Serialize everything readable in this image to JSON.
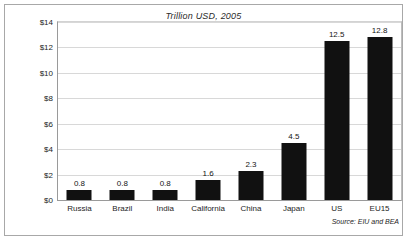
{
  "figure": {
    "title": "Trillion USD, 2005",
    "source_note": "Source: EIU and BEA"
  },
  "colors": {
    "bar": "#111111",
    "gridline": "#d8d8d8",
    "axis": "#9a9a9a",
    "frame": "#a8a8a8",
    "text": "#1d1d1d"
  },
  "chart_data": {
    "type": "bar",
    "title": "Trillion USD, 2005",
    "xlabel": "",
    "ylabel": "",
    "ylim": [
      0,
      14
    ],
    "grid": true,
    "legend": false,
    "categories": [
      "Russia",
      "Brazil",
      "India",
      "California",
      "China",
      "Japan",
      "US",
      "EU15"
    ],
    "values": [
      0.8,
      0.8,
      0.8,
      1.6,
      2.3,
      4.5,
      12.5,
      12.8
    ],
    "value_labels": [
      "0.8",
      "0.8",
      "0.8",
      "1.6",
      "2.3",
      "4.5",
      "12.5",
      "12.8"
    ],
    "ytick_values": [
      0,
      2,
      4,
      6,
      8,
      10,
      12,
      14
    ],
    "ytick_labels": [
      "$0",
      "$2",
      "$4",
      "$6",
      "$8",
      "$10",
      "$12",
      "$14"
    ],
    "annotations": [
      "Source: EIU and BEA"
    ]
  }
}
